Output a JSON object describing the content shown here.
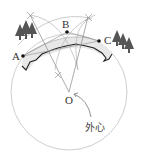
{
  "diagram": {
    "points": {
      "A": {
        "label": "A",
        "x": 23,
        "y": 56
      },
      "B": {
        "label": "B",
        "x": 67,
        "y": 32
      },
      "C": {
        "label": "C",
        "x": 99,
        "y": 41
      },
      "O": {
        "label": "O",
        "x": 69,
        "y": 92
      }
    },
    "circumcircle": {
      "cx": 69,
      "cy": 92,
      "r": 58
    },
    "annotation": {
      "label": "外心"
    },
    "colors": {
      "circle": "#c8c8c8",
      "construction": "#9a9a9a",
      "river_band": "#e6e6e6",
      "river_bank": "#222222",
      "trees": "#555555"
    }
  }
}
